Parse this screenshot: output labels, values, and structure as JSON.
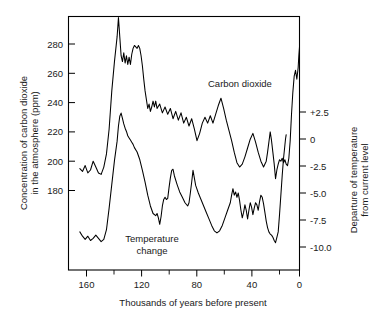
{
  "chart_data": {
    "type": "line",
    "title": "",
    "xlabel": "Thousands of years before present",
    "ylabel": "Concentration of carbon dioxide in the atmosphere (ppm)",
    "y2label": "Departure of temperature from current level",
    "xlabel_lines": [
      "Thousands of years before present"
    ],
    "ylabel_lines": [
      "Concentration of carbon dioxide",
      "in the atmosphere (ppm)"
    ],
    "y2label_lines": [
      "Departure of temperature",
      "from current level"
    ],
    "grid": false,
    "legend_position": "inline-annotation",
    "x_axis": {
      "min": 168,
      "max": 0,
      "reversed": true,
      "ticks": [
        160,
        120,
        80,
        40,
        0
      ],
      "tick_labels": [
        "160",
        "120",
        "80",
        "40",
        "0"
      ],
      "minor_ticks": [
        140,
        100,
        60,
        20
      ]
    },
    "y_axis_left": {
      "min": 152,
      "max": 298,
      "ticks": [
        180,
        200,
        220,
        240,
        260,
        280
      ],
      "tick_labels": [
        "180",
        "200",
        "220",
        "240",
        "260",
        "280"
      ],
      "units": "ppm"
    },
    "y_axis_right": {
      "min": -11.6,
      "max": 6.0,
      "ticks": [
        2.5,
        0,
        -2.5,
        -5.0,
        -7.5,
        -10.0
      ],
      "tick_labels": [
        "+2.5",
        "0",
        "-2.5",
        "-5.0",
        "-7.5",
        "-10.0"
      ],
      "units": "degrees C"
    },
    "series": [
      {
        "name": "Carbon dioxide",
        "label": "Carbon dioxide",
        "axis": "left",
        "units": "ppm",
        "points": [
          [
            165,
            195
          ],
          [
            163,
            193
          ],
          [
            161,
            197
          ],
          [
            159,
            192
          ],
          [
            157,
            194
          ],
          [
            155,
            200
          ],
          [
            153,
            196
          ],
          [
            151,
            192
          ],
          [
            149,
            191
          ],
          [
            147,
            196
          ],
          [
            145,
            205
          ],
          [
            143,
            222
          ],
          [
            141,
            248
          ],
          [
            139,
            268
          ],
          [
            137,
            285
          ],
          [
            136,
            298
          ],
          [
            135,
            285
          ],
          [
            134,
            272
          ],
          [
            133,
            268
          ],
          [
            132,
            274
          ],
          [
            131,
            267
          ],
          [
            130,
            272
          ],
          [
            129,
            266
          ],
          [
            128,
            271
          ],
          [
            127,
            266
          ],
          [
            126,
            273
          ],
          [
            125,
            277
          ],
          [
            124,
            279
          ],
          [
            123,
            278
          ],
          [
            122,
            277
          ],
          [
            121,
            279
          ],
          [
            120,
            277
          ],
          [
            119,
            272
          ],
          [
            118,
            265
          ],
          [
            117,
            256
          ],
          [
            116,
            248
          ],
          [
            115,
            242
          ],
          [
            114,
            236
          ],
          [
            113,
            239
          ],
          [
            112,
            234
          ],
          [
            111,
            237
          ],
          [
            110,
            241
          ],
          [
            109,
            237
          ],
          [
            108,
            241
          ],
          [
            107,
            236
          ],
          [
            105,
            239
          ],
          [
            103,
            233
          ],
          [
            101,
            237
          ],
          [
            99,
            232
          ],
          [
            97,
            236
          ],
          [
            95,
            229
          ],
          [
            93,
            234
          ],
          [
            91,
            228
          ],
          [
            89,
            233
          ],
          [
            87,
            226
          ],
          [
            85,
            230
          ],
          [
            83,
            224
          ],
          [
            81,
            229
          ],
          [
            79,
            222
          ],
          [
            77,
            214
          ],
          [
            75,
            219
          ],
          [
            73,
            226
          ],
          [
            71,
            230
          ],
          [
            69,
            226
          ],
          [
            67,
            231
          ],
          [
            65,
            226
          ],
          [
            63,
            232
          ],
          [
            61,
            238
          ],
          [
            59,
            243
          ],
          [
            57,
            236
          ],
          [
            55,
            228
          ],
          [
            53,
            221
          ],
          [
            51,
            214
          ],
          [
            49,
            206
          ],
          [
            47,
            199
          ],
          [
            45,
            196
          ],
          [
            43,
            198
          ],
          [
            41,
            203
          ],
          [
            39,
            209
          ],
          [
            37,
            215
          ],
          [
            35,
            219
          ],
          [
            33,
            213
          ],
          [
            31,
            206
          ],
          [
            29,
            200
          ],
          [
            27,
            196
          ],
          [
            25,
            200
          ],
          [
            24,
            206
          ],
          [
            23,
            213
          ],
          [
            22,
            220
          ],
          [
            21,
            214
          ],
          [
            20,
            206
          ],
          [
            19,
            198
          ],
          [
            18,
            188
          ],
          [
            17,
            194
          ],
          [
            16,
            198
          ],
          [
            15,
            201
          ],
          [
            14,
            200
          ],
          [
            13,
            202
          ],
          [
            12,
            199
          ],
          [
            11,
            201
          ],
          [
            10,
            198
          ],
          [
            9,
            197
          ],
          [
            8,
            202
          ],
          [
            7,
            214
          ],
          [
            6,
            232
          ],
          [
            5,
            247
          ],
          [
            4,
            258
          ],
          [
            3,
            262
          ],
          [
            2,
            256
          ],
          [
            1,
            264
          ],
          [
            0.5,
            272
          ],
          [
            0,
            278
          ]
        ]
      },
      {
        "name": "Temperature change",
        "label": "Temperature change",
        "axis": "right",
        "units": "degrees C",
        "points": [
          [
            165,
            -8.6
          ],
          [
            163,
            -9.0
          ],
          [
            161,
            -9.3
          ],
          [
            159,
            -9.0
          ],
          [
            157,
            -9.4
          ],
          [
            155,
            -9.2
          ],
          [
            153,
            -8.9
          ],
          [
            151,
            -9.2
          ],
          [
            149,
            -9.5
          ],
          [
            147,
            -9.3
          ],
          [
            145,
            -8.4
          ],
          [
            143,
            -6.4
          ],
          [
            141,
            -4.2
          ],
          [
            139,
            -2.0
          ],
          [
            137,
            -0.2
          ],
          [
            136,
            1.2
          ],
          [
            135,
            2.1
          ],
          [
            134,
            2.4
          ],
          [
            133,
            1.9
          ],
          [
            132,
            1.4
          ],
          [
            131,
            1.0
          ],
          [
            130,
            0.7
          ],
          [
            129,
            0.3
          ],
          [
            128,
            0.1
          ],
          [
            127,
            -0.1
          ],
          [
            126,
            -0.3
          ],
          [
            125,
            -0.5
          ],
          [
            124,
            -0.8
          ],
          [
            122,
            -1.2
          ],
          [
            120,
            -1.9
          ],
          [
            118,
            -2.9
          ],
          [
            116,
            -4.0
          ],
          [
            114,
            -5.2
          ],
          [
            112,
            -6.2
          ],
          [
            110,
            -6.9
          ],
          [
            108,
            -7.1
          ],
          [
            107,
            -6.9
          ],
          [
            106,
            -7.3
          ],
          [
            105,
            -7.9
          ],
          [
            104,
            -7.2
          ],
          [
            103,
            -6.2
          ],
          [
            102,
            -5.6
          ],
          [
            101,
            -5.4
          ],
          [
            100,
            -5.6
          ],
          [
            99,
            -5.5
          ],
          [
            98,
            -4.5
          ],
          [
            97,
            -3.6
          ],
          [
            96,
            -2.9
          ],
          [
            95,
            -2.8
          ],
          [
            94,
            -3.4
          ],
          [
            92,
            -4.2
          ],
          [
            90,
            -4.9
          ],
          [
            88,
            -5.4
          ],
          [
            86,
            -5.9
          ],
          [
            84,
            -6.2
          ],
          [
            83,
            -5.9
          ],
          [
            82,
            -5.0
          ],
          [
            81,
            -4.0
          ],
          [
            80,
            -2.9
          ],
          [
            79,
            -3.6
          ],
          [
            78,
            -4.3
          ],
          [
            76,
            -5.0
          ],
          [
            74,
            -5.6
          ],
          [
            72,
            -6.2
          ],
          [
            70,
            -6.8
          ],
          [
            68,
            -7.4
          ],
          [
            66,
            -8.0
          ],
          [
            64,
            -8.5
          ],
          [
            62,
            -8.7
          ],
          [
            60,
            -8.5
          ],
          [
            58,
            -8.0
          ],
          [
            56,
            -7.3
          ],
          [
            54,
            -6.6
          ],
          [
            52,
            -5.9
          ],
          [
            51,
            -5.2
          ],
          [
            50,
            -4.6
          ],
          [
            49,
            -5.2
          ],
          [
            48,
            -4.9
          ],
          [
            47,
            -5.4
          ],
          [
            46,
            -5.0
          ],
          [
            45,
            -5.7
          ],
          [
            44,
            -6.6
          ],
          [
            43,
            -7.3
          ],
          [
            42,
            -6.8
          ],
          [
            41,
            -6.1
          ],
          [
            40,
            -6.6
          ],
          [
            39,
            -7.4
          ],
          [
            38,
            -6.6
          ],
          [
            37,
            -5.9
          ],
          [
            36,
            -6.3
          ],
          [
            35,
            -7.0
          ],
          [
            34,
            -6.4
          ],
          [
            33,
            -5.9
          ],
          [
            32,
            -6.1
          ],
          [
            31,
            -6.6
          ],
          [
            30,
            -5.8
          ],
          [
            29,
            -5.2
          ],
          [
            28,
            -5.4
          ],
          [
            27,
            -6.0
          ],
          [
            26,
            -6.8
          ],
          [
            25,
            -7.6
          ],
          [
            24,
            -8.2
          ],
          [
            23,
            -8.6
          ],
          [
            22,
            -8.8
          ],
          [
            21,
            -8.9
          ],
          [
            20,
            -9.1
          ],
          [
            19,
            -9.4
          ],
          [
            18,
            -9.6
          ],
          [
            17,
            -9.1
          ],
          [
            16,
            -8.6
          ],
          [
            15,
            -7.0
          ],
          [
            14,
            -5.2
          ],
          [
            13,
            -3.4
          ],
          [
            12,
            -1.8
          ],
          [
            11,
            -0.6
          ],
          [
            10.5,
            0.0
          ],
          [
            10,
            0.4
          ]
        ]
      }
    ],
    "annotations": [
      {
        "text": "Carbon dioxide",
        "x_kyr": 55,
        "y_ppm": 247,
        "align": "left"
      },
      {
        "text": "Temperature",
        "x_kyr": 108,
        "y_ppm": 168,
        "align": "center"
      },
      {
        "text": "change",
        "x_kyr": 108,
        "y_ppm": 161,
        "align": "center"
      }
    ]
  },
  "labels": {
    "series_carbon_dioxide": "Carbon dioxide",
    "series_temperature_line1": "Temperature",
    "series_temperature_line2": "change",
    "x_axis_title": "Thousands of years before present",
    "y_axis_left_title_line1": "Concentration of carbon dioxide",
    "y_axis_left_title_line2": "in the atmosphere (ppm)",
    "y_axis_right_title_line1": "Departure of temperature",
    "y_axis_right_title_line2": "from current level",
    "x_ticks": [
      "160",
      "120",
      "80",
      "40",
      "0"
    ],
    "y_left_ticks": [
      "280",
      "260",
      "240",
      "220",
      "200",
      "180"
    ],
    "y_right_ticks": [
      "+2.5",
      "0",
      "-2.5",
      "-5.0",
      "-7.5",
      "-10.0"
    ]
  },
  "colors": {
    "background": "#ffffff",
    "axis": "#000000",
    "curve": "#000000",
    "text": "#1a1a1a"
  }
}
